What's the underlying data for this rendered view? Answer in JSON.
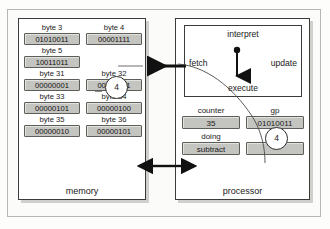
{
  "diagram": {
    "memory": {
      "caption": "memory",
      "rows": [
        [
          {
            "label": "byte 3",
            "value": "01010011"
          },
          {
            "label": "byte 4",
            "value": "00001111"
          }
        ],
        [
          {
            "label": "byte 5",
            "value": "10011011"
          },
          {
            "label": "",
            "value": ""
          }
        ],
        [
          {
            "label": "byte 31",
            "value": "00000001"
          },
          {
            "label": "byte 32",
            "value": "00000011"
          }
        ],
        [
          {
            "label": "byte 33",
            "value": "00000101"
          },
          {
            "label": "byte 34",
            "value": "00000100"
          }
        ],
        [
          {
            "label": "byte 35",
            "value": "00000010"
          },
          {
            "label": "byte 36",
            "value": "00000101"
          }
        ]
      ],
      "token": "4"
    },
    "processor": {
      "caption": "processor",
      "interpret": {
        "title": "interpret",
        "fetch": "fetch",
        "update": "update",
        "execute": "execute"
      },
      "registers": [
        [
          {
            "label": "counter",
            "value": "35"
          },
          {
            "label": "gp",
            "value": "01010011"
          }
        ],
        [
          {
            "label": "doing",
            "value": "subtract"
          },
          {
            "label": "using",
            "value": "4"
          }
        ]
      ],
      "using_token": "4"
    },
    "colors": {
      "cell_fill": "#c4c4c0",
      "cell_border": "#5d5d5a",
      "panel_border": "#3b3b3b",
      "arrow": "#111111"
    }
  }
}
